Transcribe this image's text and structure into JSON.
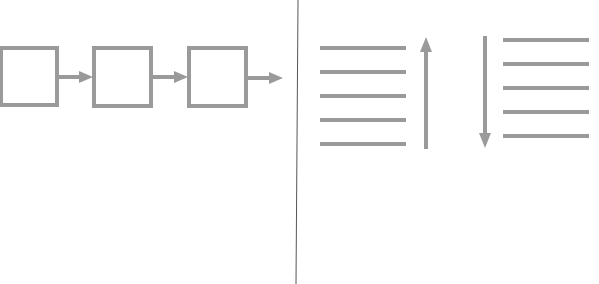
{
  "colors": {
    "shape": "#9a9a9a",
    "divider": "#555555",
    "background": "#ffffff"
  },
  "left_panel": {
    "description": "chain of boxes connected by arrows",
    "boxes": [
      {
        "x": 1,
        "y": 48,
        "w": 56,
        "h": 57
      },
      {
        "x": 94,
        "y": 48,
        "w": 57,
        "h": 58
      },
      {
        "x": 189,
        "y": 48,
        "w": 57,
        "h": 58
      }
    ],
    "arrows": [
      {
        "x1": 57,
        "y1": 77,
        "x2": 93,
        "y2": 77
      },
      {
        "x1": 151,
        "y1": 77,
        "x2": 188,
        "y2": 77
      },
      {
        "x1": 246,
        "y1": 78,
        "x2": 283,
        "y2": 78
      }
    ]
  },
  "divider": {
    "x_top": 298,
    "x_bottom": 296,
    "y1": 0,
    "y2": 284
  },
  "right_panel": {
    "stack_left": {
      "lines": [
        {
          "x1": 320,
          "x2": 406,
          "y": 48
        },
        {
          "x1": 320,
          "x2": 406,
          "y": 72
        },
        {
          "x1": 320,
          "x2": 406,
          "y": 96
        },
        {
          "x1": 320,
          "x2": 406,
          "y": 120
        },
        {
          "x1": 320,
          "x2": 406,
          "y": 144
        }
      ],
      "arrow": {
        "direction": "up",
        "x": 426,
        "y_tail": 149,
        "y_head": 37
      }
    },
    "stack_right": {
      "lines": [
        {
          "x1": 503,
          "x2": 589,
          "y": 40
        },
        {
          "x1": 503,
          "x2": 589,
          "y": 64
        },
        {
          "x1": 503,
          "x2": 589,
          "y": 88
        },
        {
          "x1": 503,
          "x2": 589,
          "y": 112
        },
        {
          "x1": 503,
          "x2": 589,
          "y": 136
        }
      ],
      "arrow": {
        "direction": "down",
        "x": 485,
        "y_tail": 36,
        "y_head": 148
      }
    }
  }
}
